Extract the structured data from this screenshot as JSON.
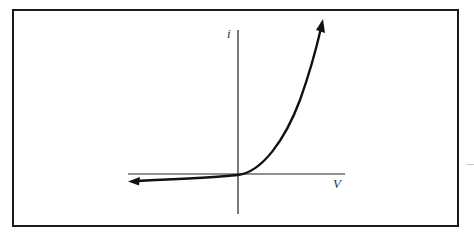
{
  "diagram": {
    "type": "diode_iv_characteristic",
    "axes": {
      "vertical_label": "i",
      "horizontal_label": "V"
    },
    "curve": {
      "shape": "exponential",
      "left_arrow": true,
      "right_arrow": true
    },
    "colors": {
      "line": "#111111",
      "frame": "#1a1a1a",
      "axis": "#222222",
      "label": "#333333"
    }
  }
}
